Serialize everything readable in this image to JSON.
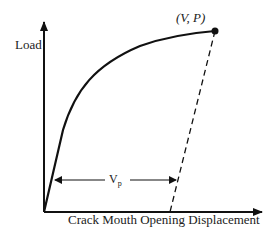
{
  "diagram": {
    "y_axis_label": "Load",
    "x_axis_label": "Crack Mouth Opening Displacement",
    "peak_point_label": "(V, P)",
    "plastic_label_main": "V",
    "plastic_label_sub": "p",
    "colors": {
      "line": "#111111",
      "background": "#ffffff"
    }
  }
}
